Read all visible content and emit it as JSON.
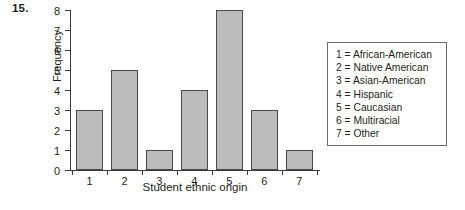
{
  "problem_number": "15.",
  "chart_data": {
    "type": "bar",
    "title": "",
    "xlabel": "Student ethnic origin",
    "ylabel": "Frequency",
    "categories": [
      "1",
      "2",
      "3",
      "4",
      "5",
      "6",
      "7"
    ],
    "values": [
      3,
      5,
      1,
      4,
      8,
      3,
      1
    ],
    "ylim": [
      0,
      8
    ],
    "yticks": [
      "0",
      "1",
      "2",
      "3",
      "4",
      "5",
      "6",
      "7",
      "8"
    ],
    "xticks": [
      "1",
      "2",
      "3",
      "4",
      "5",
      "6",
      "7"
    ],
    "grid": false,
    "legend_position": "right-outside",
    "bar_color": "#bcbcbc",
    "bar_edge_color": "#4a4a4a",
    "axis_color": "#3b3b3b",
    "background": "#ffffff"
  },
  "legend": {
    "entries": [
      "1 = African-American",
      "2 = Native American",
      "3 = Asian-American",
      "4 = Hispanic",
      "5 = Caucasian",
      "6 = Multiracial",
      "7 = Other"
    ]
  }
}
